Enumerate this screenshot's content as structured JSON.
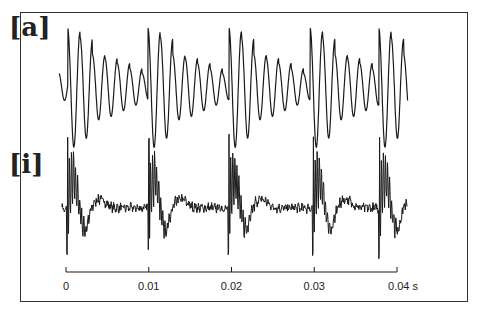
{
  "panels": [
    {
      "label": "[a]",
      "phoneme": "a"
    },
    {
      "label": "[i]",
      "phoneme": "i"
    }
  ],
  "axis": {
    "ticks": [
      "0",
      "0.01",
      "0.02",
      "0.03",
      "0.04 s"
    ],
    "tick_values": [
      0,
      0.01,
      0.02,
      0.03,
      0.04
    ],
    "unit": "s"
  },
  "colors": {
    "trace": "#1a1a1a",
    "frame": "#333333",
    "background": "#ffffff"
  },
  "chart_data": [
    {
      "type": "line",
      "title": "[a]",
      "xlabel": "s",
      "ylabel": "",
      "x_range": [
        -0.0008,
        0.0413
      ],
      "description": "Periodic speech waveform of vowel [a]; ~5 pitch periods of ~0.0097 s each, each period has a large double-peak onset followed by decaying oscillations (~6 formant cycles).",
      "period_s": 0.0097,
      "period_onsets_s": [
        0.0002,
        0.0099,
        0.0197,
        0.0295,
        0.0378
      ],
      "cycle_amplitudes_per_period": [
        1.0,
        0.9,
        0.6,
        0.55,
        0.45,
        0.35,
        0.25
      ],
      "grid": false,
      "legend": false
    },
    {
      "type": "line",
      "title": "[i]",
      "xlabel": "s",
      "ylabel": "",
      "x_range": [
        -0.0005,
        0.0413
      ],
      "description": "Periodic speech waveform of vowel [i]; ~5 pitch periods, each begins with a sharp high-frequency spike burst, then a slow dip and low-amplitude ripple.",
      "period_s": 0.0098,
      "period_onsets_s": [
        0.0001,
        0.0099,
        0.0196,
        0.0298,
        0.0378
      ],
      "grid": false,
      "legend": false
    }
  ]
}
